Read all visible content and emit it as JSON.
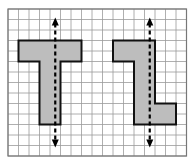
{
  "figure": {
    "grid": {
      "x0": 8,
      "y0": 9,
      "cell": 10.5,
      "cols": 17,
      "rows": 14,
      "line_color": "#9a9a9a",
      "border_color": "#777777"
    },
    "shape_fill": "#bdbdbd",
    "shape_stroke": "#111111",
    "shapes": [
      {
        "name": "T-shape",
        "cells_polygon": [
          [
            1,
            3
          ],
          [
            7,
            3
          ],
          [
            7,
            5
          ],
          [
            5,
            5
          ],
          [
            5,
            11
          ],
          [
            3,
            11
          ],
          [
            3,
            5
          ],
          [
            1,
            5
          ]
        ],
        "axis_col": 4,
        "arrow_top_row": 1,
        "arrow_bottom_row": 13
      },
      {
        "name": "L-shape",
        "cells_polygon": [
          [
            10,
            3
          ],
          [
            14,
            3
          ],
          [
            14,
            9
          ],
          [
            16,
            9
          ],
          [
            16,
            11
          ],
          [
            12,
            11
          ],
          [
            12,
            5
          ],
          [
            10,
            5
          ]
        ],
        "axis_col": 13,
        "arrow_top_row": 1,
        "arrow_bottom_row": 13
      }
    ]
  }
}
